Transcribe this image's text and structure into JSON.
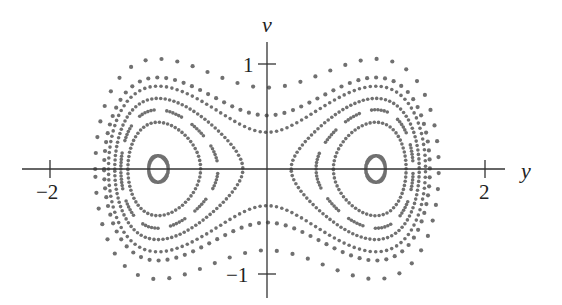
{
  "chart_data": {
    "type": "scatter",
    "title": "",
    "subtitle": "",
    "xlabel": "y",
    "ylabel": "v",
    "xlim": [
      -2.3,
      2.3
    ],
    "ylim": [
      -1.3,
      1.3
    ],
    "grid": false,
    "legend": null,
    "x_ticks": [
      {
        "value": -2,
        "label": "−2"
      },
      {
        "value": 2,
        "label": "2"
      }
    ],
    "y_ticks": [
      {
        "value": 1,
        "label": "1"
      },
      {
        "value": -1,
        "label": "−1"
      }
    ],
    "equilibria": [
      {
        "y": -1,
        "v": 0
      },
      {
        "y": 1,
        "v": 0
      },
      {
        "y": 0,
        "v": 0
      }
    ],
    "series": [
      {
        "name": "small loop left well",
        "energy": -0.242,
        "well": "left",
        "style": "solid"
      },
      {
        "name": "small loop right well",
        "energy": -0.242,
        "well": "right",
        "style": "solid"
      },
      {
        "name": "orbit E=-0.151 left",
        "energy": -0.151,
        "well": "left",
        "style": "dense-dots",
        "spacing": 4.2
      },
      {
        "name": "orbit E=-0.151 right",
        "energy": -0.151,
        "well": "right",
        "style": "dense-dots",
        "spacing": 4.2
      },
      {
        "name": "orbit E=-0.091 left",
        "energy": -0.091,
        "well": "left",
        "style": "dashes",
        "spacing": 3.2
      },
      {
        "name": "orbit E=-0.091 right",
        "energy": -0.091,
        "well": "right",
        "style": "dashes",
        "spacing": 3.2
      },
      {
        "name": "orbit E=-0.024 left",
        "energy": -0.024,
        "well": "left",
        "style": "dense-dots",
        "spacing": 4.5
      },
      {
        "name": "orbit E=-0.024 right",
        "energy": -0.024,
        "well": "right",
        "style": "dense-dots",
        "spacing": 4.5
      },
      {
        "name": "outer orbit E=0.061",
        "energy": 0.061,
        "well": "both",
        "style": "dense-dots",
        "spacing": 5.5
      },
      {
        "name": "outer orbit E=0.13",
        "energy": 0.13,
        "well": "both",
        "style": "sparse-dots",
        "spacing": 9
      },
      {
        "name": "outer orbit E=0.30",
        "energy": 0.3,
        "well": "both",
        "style": "sparse-dots",
        "spacing": 16
      }
    ]
  },
  "layout": {
    "origin_px": [
      267,
      169
    ],
    "x_scale_px": 109,
    "y_scale_px": 105,
    "dot_color": "#707070",
    "axis_color": "#333333"
  },
  "labels": {
    "x_axis": "y",
    "y_axis": "v",
    "tick_neg2": "−2",
    "tick_pos2": "2",
    "tick_pos1": "1",
    "tick_neg1": "−1"
  }
}
